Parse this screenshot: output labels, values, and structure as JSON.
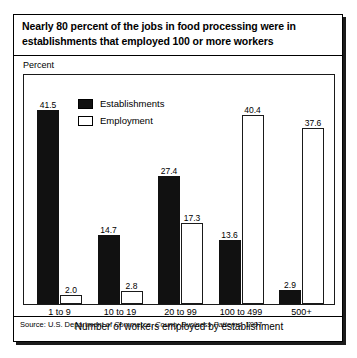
{
  "figure": {
    "title": "Nearly 80 percent of the jobs in food processing were in establishments that employed 100 or more workers",
    "y_caption": "Percent",
    "x_title": "Number of workers employed by establishment",
    "source_prefix": "Source: U.S. Department of Commerce, ",
    "source_italic": "County Business Patterns",
    "source_suffix": ", 1997"
  },
  "legend": {
    "items": [
      {
        "label": "Establishments",
        "swatch": "filled-black-square",
        "color": "#111111"
      },
      {
        "label": "Employment",
        "swatch": "hollow-white-square",
        "color": "#ffffff"
      }
    ]
  },
  "chart_data": {
    "type": "bar",
    "title": "Nearly 80 percent of the jobs in food processing were in establishments that employed 100 or more workers",
    "xlabel": "Number of workers employed by establishment",
    "ylabel": "Percent",
    "categories": [
      "1 to 9",
      "10 to 19",
      "20 to 99",
      "100 to 499",
      "500+"
    ],
    "series": [
      {
        "name": "Establishments",
        "values": [
          41.5,
          14.7,
          27.4,
          13.6,
          2.9
        ],
        "color": "#111111"
      },
      {
        "name": "Employment",
        "values": [
          2.0,
          2.8,
          17.3,
          40.4,
          37.6
        ],
        "color": "#ffffff"
      }
    ],
    "value_labels": [
      [
        "41.5",
        "2.0"
      ],
      [
        "14.7",
        "2.8"
      ],
      [
        "27.4",
        "17.3"
      ],
      [
        "13.6",
        "40.4"
      ],
      [
        "2.9",
        "37.6"
      ]
    ],
    "ylim": [
      0,
      48.9
    ],
    "grid": false,
    "legend_position": "inside-top-left",
    "source": "Source: U.S. Department of Commerce, County Business Patterns, 1997"
  }
}
